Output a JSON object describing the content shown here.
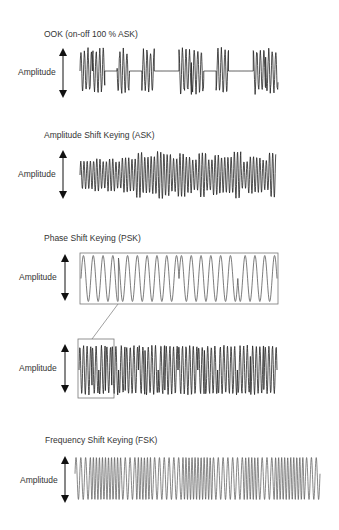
{
  "diagram": {
    "panels": [
      {
        "id": "ook",
        "title": "OOK (on-off 100 % ASK)",
        "ylabel": "Amplitude",
        "waveform": "on-off keyed carrier bursts separated by flat baseline",
        "bits": [
          1,
          1,
          0,
          1,
          0,
          1,
          0,
          0,
          1,
          1,
          0,
          1,
          0,
          0,
          1,
          1
        ]
      },
      {
        "id": "ask",
        "title": "Amplitude Shift Keying (ASK)",
        "ylabel": "Amplitude",
        "waveform": "carrier with varying amplitude levels"
      },
      {
        "id": "psk",
        "title": "Phase Shift Keying (PSK)",
        "ylabel": "Amplitude",
        "waveform": "expanded view of sine carrier with phase reversals",
        "phase_flips_at": [
          0.19,
          0.5,
          0.8
        ]
      },
      {
        "id": "psk-full",
        "title": "",
        "ylabel": "Amplitude",
        "waveform": "dense PSK carrier; highlighted region is magnified above"
      },
      {
        "id": "fsk",
        "title": "Frequency Shift Keying (FSK)",
        "ylabel": "Amplitude",
        "waveform": "constant-amplitude carrier alternating between two frequencies"
      }
    ],
    "colors": {
      "line": "#333333",
      "text": "#333333",
      "box": "#777777"
    }
  }
}
